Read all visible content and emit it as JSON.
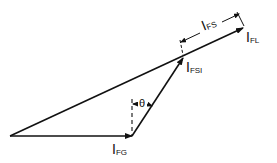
{
  "diagram": {
    "type": "phasor-diagram",
    "vectors": [
      {
        "id": "I_FG",
        "main": "I",
        "sub": "FG"
      },
      {
        "id": "I_FSI",
        "main": "I",
        "sub": "FSI"
      },
      {
        "id": "I_FL",
        "main": "I",
        "sub": "FL"
      }
    ],
    "dimension": {
      "main": "I",
      "sub": "FS"
    },
    "angle": {
      "symbol": "θ"
    }
  }
}
